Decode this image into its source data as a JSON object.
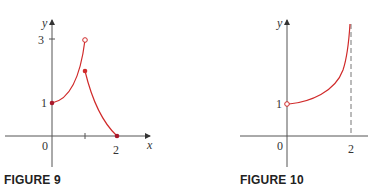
{
  "figures": [
    {
      "caption": "FIGURE 9",
      "x_axis_label": "x",
      "y_axis_label": "y",
      "origin_label": "0",
      "x_tick_labels": [
        "2"
      ],
      "y_tick_labels": [
        "1",
        "3"
      ],
      "curve_color": "#d02a2a",
      "pieces": [
        {
          "domain": "0 ≤ x < 1",
          "start": [
            0,
            1
          ],
          "end": [
            1,
            3
          ],
          "start_marker": "filled",
          "end_marker": "open",
          "shape": "increasing, concave up"
        },
        {
          "domain": "1 ≤ x ≤ 2",
          "start": [
            1,
            2
          ],
          "end": [
            2,
            0
          ],
          "start_marker": "filled",
          "end_marker": "filled",
          "shape": "decreasing, concave up"
        }
      ],
      "x_ticks": [
        1,
        2
      ]
    },
    {
      "caption": "FIGURE 10",
      "x_axis_label": "",
      "y_axis_label": "y",
      "origin_label": "0",
      "x_tick_labels": [
        "2"
      ],
      "y_tick_labels": [
        "1"
      ],
      "curve_color": "#d02a2a",
      "pieces": [
        {
          "domain": "0 < x < 2",
          "start": [
            0,
            1
          ],
          "start_marker": "open",
          "shape": "increasing to vertical asymptote at x = 2"
        }
      ],
      "asymptote": {
        "x": 2,
        "style": "dashed"
      }
    }
  ]
}
